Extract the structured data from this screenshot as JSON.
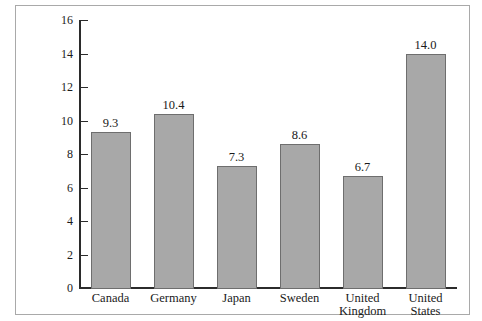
{
  "chart_data": {
    "type": "bar",
    "title": "",
    "subtitle": "",
    "xlabel": "",
    "ylabel": "",
    "categories": [
      "Canada",
      "Germany",
      "Japan",
      "Sweden",
      "United Kingdom",
      "United States"
    ],
    "values": [
      9.3,
      10.4,
      7.3,
      8.6,
      6.7,
      14.0
    ],
    "value_labels": [
      "9.3",
      "10.4",
      "7.3",
      "8.6",
      "6.7",
      "14.0"
    ],
    "ylim": [
      0,
      16
    ],
    "y_ticks": [
      0,
      2,
      4,
      6,
      8,
      10,
      12,
      14,
      16
    ],
    "y_tick_labels": [
      "0",
      "2",
      "4",
      "6",
      "8",
      "10",
      "12",
      "14",
      "16"
    ],
    "grid": false,
    "legend": null,
    "legend_position": "none",
    "bar_fill_color": "#a8a8a8",
    "bar_border_color": "#6e6e6e",
    "axis_color": "#2b2b2b",
    "frame_color": "#a9a9a9",
    "background_color": "#ffffff"
  }
}
